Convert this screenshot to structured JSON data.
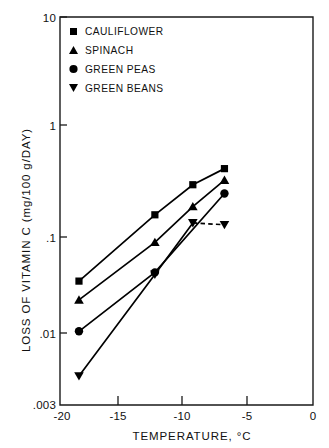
{
  "chart_data": {
    "type": "scatter",
    "title": "",
    "xlabel": "TEMPERATURE, °C",
    "ylabel": "LOSS OF VITAMIN C (mg/100 g/DAY)",
    "yscale": "log",
    "xscale": "linear",
    "xlim": [
      -20,
      0
    ],
    "ylim": [
      0.003,
      10
    ],
    "grid": false,
    "legend_position": "top-left inside axes",
    "xticks": [
      -20,
      -15,
      -10,
      -5,
      0
    ],
    "xticklabels": [
      "-20",
      "-15",
      "-10",
      "-5",
      "0"
    ],
    "yticks": [
      10,
      1,
      0.1,
      0.01,
      0.003
    ],
    "yticklabels": [
      "10",
      "1",
      ".1",
      ".01",
      ".003"
    ],
    "series": [
      {
        "name": "CAULIFLOWER",
        "marker": "square",
        "line": "solid",
        "x": [
          -18.5,
          -12.5,
          -9.5,
          -7.0
        ],
        "y": [
          0.04,
          0.16,
          0.3,
          0.42
        ]
      },
      {
        "name": "SPINACH",
        "marker": "triangle-up",
        "line": "solid",
        "x": [
          -18.5,
          -12.5,
          -9.5,
          -7.0
        ],
        "y": [
          0.027,
          0.09,
          0.19,
          0.33
        ]
      },
      {
        "name": "GREEN PEAS",
        "marker": "circle",
        "line": "solid",
        "x": [
          -18.5,
          -12.5,
          -7.0
        ],
        "y": [
          0.014,
          0.048,
          0.25
        ]
      },
      {
        "name": "GREEN BEANS",
        "marker": "triangle-down",
        "line": "dashed",
        "x": [
          -18.5,
          -12.5,
          -9.5,
          -7.0
        ],
        "y": [
          0.0055,
          0.046,
          0.135,
          0.13
        ]
      }
    ]
  },
  "legend": {
    "entries": [
      {
        "label": "CAULIFLOWER",
        "marker": "square-marker-icon"
      },
      {
        "label": "SPINACH",
        "marker": "triangle-up-marker-icon"
      },
      {
        "label": "GREEN PEAS",
        "marker": "circle-marker-icon"
      },
      {
        "label": "GREEN BEANS",
        "marker": "triangle-down-marker-icon"
      }
    ]
  },
  "axes": {
    "x_title": "TEMPERATURE, °C",
    "y_title": "LOSS OF VITAMIN C (mg/100 g/DAY)",
    "x_tick_labels": [
      "-20",
      "-15",
      "-10",
      "-5",
      "0"
    ],
    "y_tick_labels": [
      "10",
      "1",
      ".1",
      ".01",
      ".003"
    ]
  },
  "colors": {
    "ink": "#000000",
    "background": "#ffffff"
  }
}
